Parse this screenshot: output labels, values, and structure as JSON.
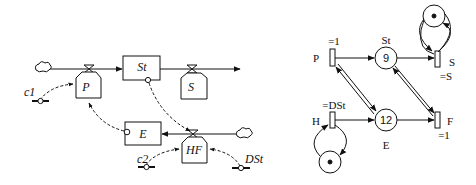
{
  "stock_flow_diagram": {
    "stocks": [
      {
        "id": "St",
        "label": "St"
      },
      {
        "id": "E",
        "label": "E"
      }
    ],
    "flows": [
      {
        "id": "P",
        "label": "P"
      },
      {
        "id": "S",
        "label": "S"
      },
      {
        "id": "HF",
        "label": "HF"
      }
    ],
    "constants": [
      {
        "id": "c1",
        "label": "c1"
      },
      {
        "id": "c2",
        "label": "c2"
      },
      {
        "id": "DSt",
        "label": "DSt"
      }
    ]
  },
  "petri_net": {
    "places": [
      {
        "id": "St",
        "label": "St",
        "tokens": "9"
      },
      {
        "id": "E",
        "label": "E",
        "tokens": "12"
      },
      {
        "id": "self_S",
        "tokens": "•"
      },
      {
        "id": "self_H",
        "tokens": "•"
      }
    ],
    "transitions": [
      {
        "id": "P",
        "label": "P",
        "rate": "=1"
      },
      {
        "id": "S",
        "label": "S",
        "rate": "=S"
      },
      {
        "id": "H",
        "label": "H",
        "rate": "=DSt"
      },
      {
        "id": "F",
        "label": "F",
        "rate": "=1"
      }
    ]
  }
}
